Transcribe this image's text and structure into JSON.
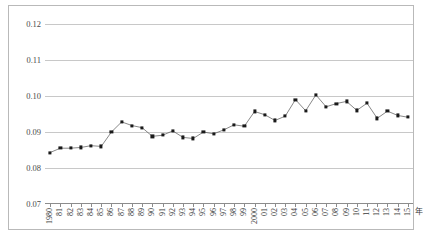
{
  "chart_data": {
    "type": "line",
    "title": "",
    "xlabel": "年",
    "ylabel": "",
    "grid": true,
    "legend": "none",
    "xlim": [
      1980,
      2015
    ],
    "ylim": [
      0.07,
      0.12
    ],
    "ytick_labels": [
      "0.12",
      "0.11",
      "0.10",
      "0.09",
      "0.08",
      "0.07"
    ],
    "ytick_values": [
      0.12,
      0.11,
      0.1,
      0.09,
      0.08,
      0.07
    ],
    "x_tick_labels": [
      "1980",
      "81",
      "82",
      "83",
      "84",
      "85",
      "86",
      "87",
      "88",
      "89",
      "90",
      "91",
      "92",
      "93",
      "94",
      "95",
      "96",
      "97",
      "98",
      "99",
      "2000",
      "01",
      "02",
      "03",
      "04",
      "05",
      "06",
      "07",
      "08",
      "09",
      "10",
      "11",
      "12",
      "13",
      "14",
      "15"
    ],
    "categories": [
      1980,
      1981,
      1982,
      1983,
      1984,
      1985,
      1986,
      1987,
      1988,
      1989,
      1990,
      1991,
      1992,
      1993,
      1994,
      1995,
      1996,
      1997,
      1998,
      1999,
      2000,
      2001,
      2002,
      2003,
      2004,
      2005,
      2006,
      2007,
      2008,
      2009,
      2010,
      2011,
      2012,
      2013,
      2014,
      2015
    ],
    "values": [
      0.0843,
      0.0855,
      0.0855,
      0.0857,
      0.0862,
      0.086,
      0.09,
      0.0928,
      0.0918,
      0.0912,
      0.0888,
      0.0891,
      0.0903,
      0.0885,
      0.0882,
      0.09,
      0.0895,
      0.0906,
      0.092,
      0.0916,
      0.0957,
      0.0948,
      0.0932,
      0.0944,
      0.099,
      0.0959,
      0.1003,
      0.097,
      0.0979,
      0.0985,
      0.096,
      0.098,
      0.0938,
      0.0958,
      0.0946,
      0.0941
    ],
    "marker": "square",
    "marker_color": "#1a1a1a",
    "line_color": "#555555",
    "grid_color": "#c8c8c8",
    "frame_color": "#b9b9b9"
  }
}
